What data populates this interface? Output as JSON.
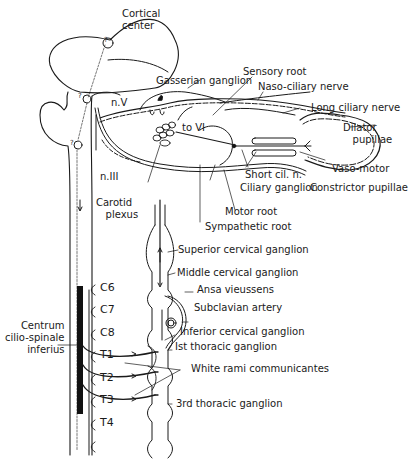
{
  "diagram": {
    "type": "anatomical-pathway",
    "colors": {
      "line": "#1a1a1a",
      "background": "#ffffff"
    },
    "labels": {
      "cortical_center": "Cortical\ncenter",
      "gasserian_ganglion": "Gasserian ganglion",
      "sensory_root": "Sensory root",
      "naso_ciliary_nerve": "Naso-ciliary nerve",
      "long_ciliary_nerve": "Long ciliary nerve",
      "dilator_pupillae": "Dilator\n   pupillae",
      "n_v": "n.V",
      "to_vi": "to VI",
      "n_iii": "n.III",
      "short_cil_n": "Short cil. n.",
      "vaso_motor": "Vaso-motor",
      "ciliary_ganglion": "Ciliary ganglion",
      "constrictor_pupillae": "Constrictor pupillae",
      "carotid_plexus": "Carotid\n   plexus",
      "motor_root": "Motor root",
      "sympathetic_root": "Sympathetic root",
      "superior_cervical_ganglion": "Superior cervical ganglion",
      "middle_cervical_ganglion": "Middle cervical ganglion",
      "ansa_vieussens": "Ansa vieussens",
      "subclavian_artery": "Subclavian artery",
      "inferior_cervical_ganglion": "Inferior cervical ganglion",
      "first_thoracic_ganglion": "Ist thoracic ganglion",
      "white_rami_communicantes": "White rami communicantes",
      "third_thoracic_ganglion": "3rd thoracic ganglion",
      "centrum_cilio_spinale": "Centrum\ncilio-spinale\ninferius"
    },
    "spinal_segments": [
      "C6",
      "C7",
      "C8",
      "T1",
      "T2",
      "T3",
      "T4"
    ],
    "question_marks": [
      "?",
      "?",
      "?"
    ]
  }
}
